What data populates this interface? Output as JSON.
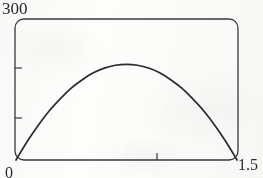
{
  "chart_data": {
    "type": "line",
    "title": "",
    "subtitle": "",
    "xlabel": "",
    "ylabel": "",
    "xlim": [
      0,
      1.5
    ],
    "ylim": [
      0,
      300
    ],
    "grid": false,
    "legend": null,
    "x_ticks": [
      1.0
    ],
    "x_tick_labels": [
      "0",
      "1.5"
    ],
    "y_ticks": [
      100,
      200
    ],
    "y_tick_labels": [
      "300"
    ],
    "annotations": [],
    "series": [
      {
        "name": "curve",
        "color": "#2b2b2b",
        "x": [
          0.0,
          0.075,
          0.15,
          0.225,
          0.3,
          0.375,
          0.45,
          0.525,
          0.6,
          0.675,
          0.75,
          0.825,
          0.9,
          0.975,
          1.05,
          1.125,
          1.2,
          1.275,
          1.35,
          1.425,
          1.5
        ],
        "values": [
          0,
          39,
          74,
          105,
          131,
          154,
          172,
          187,
          197,
          203,
          205,
          203,
          197,
          187,
          172,
          154,
          131,
          105,
          74,
          39,
          0
        ]
      }
    ]
  },
  "axes": {
    "y_max_label": "300",
    "x_min_label": "0",
    "x_max_label": "1.5"
  },
  "style": {
    "frame_color": "#3a3a3a",
    "curve_color": "#2b2b2b",
    "background": "#fdfdfc"
  }
}
